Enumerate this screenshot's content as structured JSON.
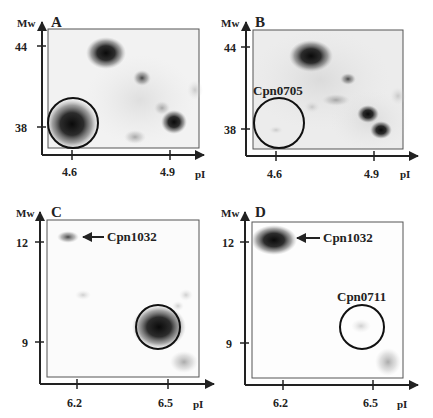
{
  "figure": {
    "panels": [
      {
        "id": "A",
        "y_axis_label": "Mw",
        "x_axis_label": "pI",
        "y_ticks": [
          "44",
          "38"
        ],
        "x_ticks": [
          "4.6",
          "4.9"
        ],
        "annotation": ""
      },
      {
        "id": "B",
        "y_axis_label": "Mw",
        "x_axis_label": "pI",
        "y_ticks": [
          "44",
          "38"
        ],
        "x_ticks": [
          "4.6",
          "4.9"
        ],
        "annotation": "Cpn0705"
      },
      {
        "id": "C",
        "y_axis_label": "Mw",
        "x_axis_label": "pI",
        "y_ticks": [
          "12",
          "9"
        ],
        "x_ticks": [
          "6.2",
          "6.5"
        ],
        "annotation": "Cpn1032"
      },
      {
        "id": "D",
        "y_axis_label": "Mw",
        "x_axis_label": "pI",
        "y_ticks": [
          "12",
          "9"
        ],
        "x_ticks": [
          "6.2",
          "6.5"
        ],
        "annotation": "Cpn1032",
        "annotation2": "Cpn0711"
      }
    ]
  }
}
